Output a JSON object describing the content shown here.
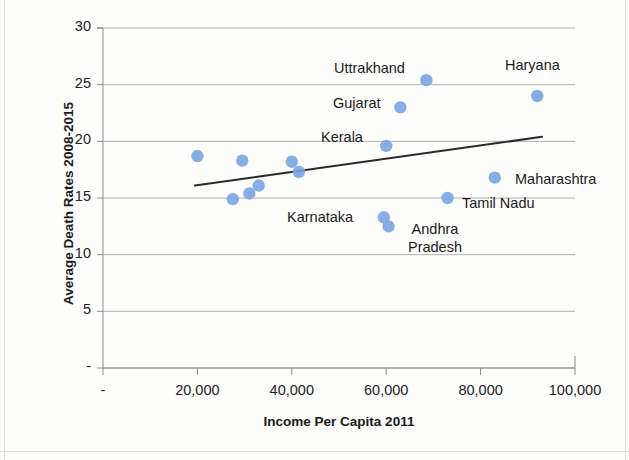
{
  "chart_data": {
    "type": "scatter",
    "title": "",
    "xlabel": "Income Per Capita 2011",
    "ylabel": "Average Death Rates 2008-2015",
    "xlim": [
      0,
      100000
    ],
    "ylim": [
      0,
      30
    ],
    "grid": true,
    "legend": "none",
    "xticks": [
      0,
      20000,
      40000,
      60000,
      80000,
      100000
    ],
    "xtick_labels": [
      "-",
      "20,000",
      "40,000",
      "60,000",
      "80,000",
      "100,000"
    ],
    "yticks": [
      0,
      5,
      10,
      15,
      20,
      25,
      30
    ],
    "ytick_labels": [
      "-",
      "5",
      "10",
      "15",
      "20",
      "25",
      "30"
    ],
    "marker_color": "#7da7e2",
    "trendline_color": "#2a2a2a",
    "points": [
      {
        "x": 20000,
        "y": 18.7,
        "label": ""
      },
      {
        "x": 27500,
        "y": 14.9,
        "label": ""
      },
      {
        "x": 29500,
        "y": 18.3,
        "label": ""
      },
      {
        "x": 31000,
        "y": 15.4,
        "label": ""
      },
      {
        "x": 33000,
        "y": 16.1,
        "label": ""
      },
      {
        "x": 40000,
        "y": 18.2,
        "label": ""
      },
      {
        "x": 41500,
        "y": 17.3,
        "label": ""
      },
      {
        "x": 60000,
        "y": 19.6,
        "label": "Kerala"
      },
      {
        "x": 59500,
        "y": 13.3,
        "label": "Karnataka"
      },
      {
        "x": 60500,
        "y": 12.5,
        "label": "Andhra Pradesh"
      },
      {
        "x": 63000,
        "y": 23.0,
        "label": "Gujarat"
      },
      {
        "x": 68500,
        "y": 25.4,
        "label": "Uttrakhand"
      },
      {
        "x": 73000,
        "y": 15.0,
        "label": "Tamil Nadu"
      },
      {
        "x": 83000,
        "y": 16.8,
        "label": "Maharashtra"
      },
      {
        "x": 92000,
        "y": 24.0,
        "label": "Haryana"
      }
    ],
    "trendline": {
      "x1": 19500,
      "y1": 16.1,
      "x2": 93000,
      "y2": 20.4
    }
  },
  "annotations": [
    {
      "name": "uttrakhand",
      "text": "Uttrakhand",
      "left": 334,
      "top": 60
    },
    {
      "name": "haryana",
      "text": "Haryana",
      "left": 505,
      "top": 57
    },
    {
      "name": "gujarat",
      "text": "Gujarat",
      "left": 333,
      "top": 95
    },
    {
      "name": "kerala",
      "text": "Kerala",
      "left": 321,
      "top": 129
    },
    {
      "name": "maharashtra",
      "text": "Maharashtra",
      "left": 515,
      "top": 171
    },
    {
      "name": "tamil-nadu",
      "text": "Tamil Nadu",
      "left": 462,
      "top": 195
    },
    {
      "name": "karnataka",
      "text": "Karnataka",
      "left": 287,
      "top": 209
    },
    {
      "name": "andhra-pradesh",
      "text": "Andhra Pradesh",
      "left": 398,
      "top": 221
    }
  ]
}
